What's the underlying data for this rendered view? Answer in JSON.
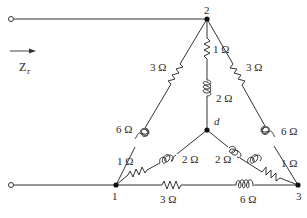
{
  "diagram": {
    "type": "circuit",
    "input_label": "Z",
    "input_label_sub": "T",
    "nodes": {
      "n1": "1",
      "n2": "2",
      "n3": "3",
      "nd": "d"
    },
    "components": {
      "r_2_1": "3 Ω",
      "l_2_1": "6 Ω",
      "r_1_low": "1 Ω",
      "r_2_3": "3 Ω",
      "l_2_3": "6 Ω",
      "r_3_low": "1 Ω",
      "r_2_d": "1 Ω",
      "l_2_d": "2 Ω",
      "l_1_d": "2 Ω",
      "l_3_d": "2 Ω",
      "r_1_3": "3 Ω",
      "l_1_3": "6 Ω"
    }
  }
}
